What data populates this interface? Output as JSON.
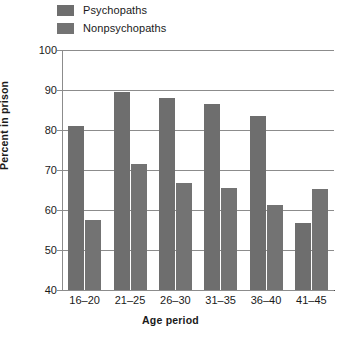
{
  "chart_data": {
    "type": "bar",
    "title": "",
    "xlabel": "Age period",
    "ylabel": "Percent in prison",
    "categories": [
      "16–20",
      "21–25",
      "26–30",
      "31–35",
      "36–40",
      "41–45"
    ],
    "series": [
      {
        "name": "Psychopaths",
        "color": "#6e6e6e",
        "values": [
          81,
          89.5,
          88,
          86.5,
          83.5,
          56.8
        ]
      },
      {
        "name": "Nonpsychopaths",
        "color": "#737373",
        "values": [
          57.5,
          71.5,
          66.8,
          65.5,
          61.3,
          65.3
        ]
      }
    ],
    "ylim": [
      40,
      100
    ],
    "yticks": [
      40,
      50,
      60,
      70,
      80,
      90,
      100
    ],
    "ytick_labels": [
      "40",
      "50",
      "60",
      "70",
      "80",
      "90",
      "100"
    ],
    "grid": true,
    "legend_position": "top-left"
  }
}
